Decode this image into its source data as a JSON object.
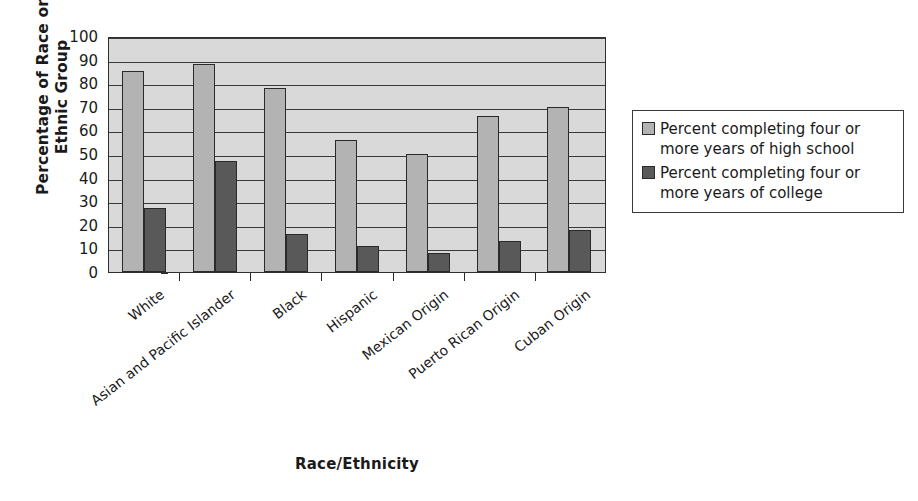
{
  "chart_data": {
    "type": "bar",
    "title": "",
    "xlabel": "Race/Ethnicity",
    "ylabel": "Percentage of Race or\nEthnic Group",
    "categories": [
      "White",
      "Asian and Pacific Islander",
      "Black",
      "Hispanic",
      "Mexican Origin",
      "Puerto Rican Origin",
      "Cuban Origin"
    ],
    "series": [
      {
        "name": "Percent completing four or more years of high school",
        "color": "#b3b3b3",
        "values": [
          85,
          88,
          78,
          56,
          50,
          66,
          70
        ]
      },
      {
        "name": "Percent completing four or more years of college",
        "color": "#595959",
        "values": [
          27,
          47,
          16,
          11,
          8,
          13,
          18
        ]
      }
    ],
    "ylim": [
      0,
      100
    ],
    "yticks": [
      100,
      90,
      80,
      70,
      60,
      50,
      40,
      30,
      20,
      10,
      0
    ],
    "ytick_labels": [
      "100",
      "90",
      "80",
      "70",
      "60",
      "50",
      "40",
      "30",
      "20",
      "10",
      "0"
    ],
    "grid": true,
    "grid_axis": "y",
    "legend_position": "right",
    "plot_background": "#d9d9d9"
  },
  "legend": {
    "entries": [
      "Percent completing four or more years of high school",
      "Percent completing four or more years of college"
    ]
  }
}
